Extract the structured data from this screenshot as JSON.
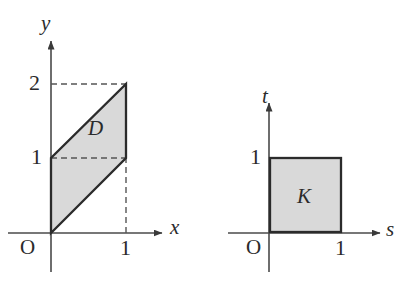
{
  "figure": {
    "background_color": "#ffffff",
    "stroke_color": "#2b2b2b",
    "fill_color": "#d9d9d9",
    "axis_color": "#4a4a4a",
    "dash_color": "#555555"
  },
  "panels": [
    {
      "id": "left",
      "name": "xy-plane",
      "axes": {
        "x": {
          "label": "x",
          "origin_label": "O",
          "ticks": [
            {
              "label": "1",
              "value": 1
            }
          ]
        },
        "y": {
          "label": "y",
          "ticks": [
            {
              "label": "1",
              "value": 1
            },
            {
              "label": "2",
              "value": 2
            }
          ]
        }
      },
      "region": {
        "label": "D",
        "shape": "parallelogram",
        "vertices": [
          {
            "x": 0,
            "y": 0
          },
          {
            "x": 0,
            "y": 1
          },
          {
            "x": 1,
            "y": 2
          },
          {
            "x": 1,
            "y": 1
          }
        ],
        "guides": [
          {
            "type": "horizontal-dashed",
            "at": 2,
            "from": 0,
            "to": 1
          },
          {
            "type": "horizontal-dashed",
            "at": 1,
            "from": 0,
            "to": 1
          },
          {
            "type": "vertical-dashed",
            "at": 1,
            "from": 0,
            "to": 1
          }
        ]
      }
    },
    {
      "id": "right",
      "name": "st-plane",
      "axes": {
        "x": {
          "label": "s",
          "origin_label": "O",
          "ticks": [
            {
              "label": "1",
              "value": 1
            }
          ]
        },
        "y": {
          "label": "t",
          "ticks": [
            {
              "label": "1",
              "value": 1
            }
          ]
        }
      },
      "region": {
        "label": "K",
        "shape": "square",
        "vertices": [
          {
            "x": 0,
            "y": 0
          },
          {
            "x": 0,
            "y": 1
          },
          {
            "x": 1,
            "y": 1
          },
          {
            "x": 1,
            "y": 0
          }
        ],
        "guides": []
      }
    }
  ],
  "labels": {
    "left_y_axis": "y",
    "left_x_axis": "x",
    "left_origin": "O",
    "left_y_tick_2": "2",
    "left_y_tick_1": "1",
    "left_x_tick_1": "1",
    "left_region": "D",
    "right_t_axis": "t",
    "right_s_axis": "s",
    "right_origin": "O",
    "right_t_tick_1": "1",
    "right_s_tick_1": "1",
    "right_region": "K"
  }
}
